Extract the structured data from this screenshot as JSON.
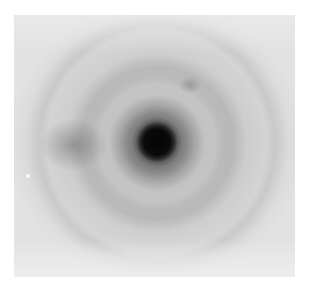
{
  "image": {
    "description": "Grayscale diffraction/scattering pattern with a dark central spot, surrounding dark halo, faint concentric rings, a darker lobe on the left and a faint spot upper-right",
    "colors": {
      "background": "#ffffff",
      "field": "#dedede",
      "core": "#040404",
      "halo": "#767676",
      "ring": "#c0c0c0"
    },
    "features": [
      {
        "name": "central-core",
        "center": [
          157,
          142
        ],
        "radius": 17
      },
      {
        "name": "dark-halo",
        "center": [
          157,
          143
        ],
        "radius": 38
      },
      {
        "name": "left-lobe",
        "center": [
          74,
          145
        ]
      },
      {
        "name": "upper-right-spot",
        "center": [
          190,
          85
        ]
      },
      {
        "name": "outer-ring",
        "center": [
          157,
          143
        ],
        "radius": 80
      }
    ]
  }
}
